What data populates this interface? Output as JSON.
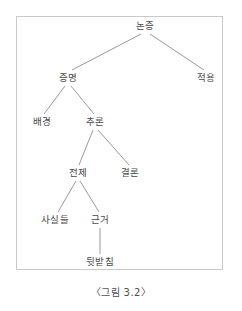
{
  "figure": {
    "caption": "〈그림 3.2〉",
    "frame": {
      "border_color": "#c9c9c9",
      "background": "#ffffff"
    },
    "line_color": "#8d8d8d",
    "text_color": "#4a4a4a"
  },
  "chart_data": {
    "type": "diagram",
    "title": "〈그림 3.2〉",
    "diagram_kind": "tree",
    "orientation": "top-down",
    "nodes": [
      {
        "id": "n0",
        "label": "논증",
        "level": 0,
        "x": 145,
        "y": 26
      },
      {
        "id": "n1",
        "label": "증명",
        "level": 1,
        "x": 68,
        "y": 78
      },
      {
        "id": "n2",
        "label": "적용",
        "level": 1,
        "x": 206,
        "y": 78
      },
      {
        "id": "n3",
        "label": "배경",
        "level": 2,
        "x": 42,
        "y": 122
      },
      {
        "id": "n4",
        "label": "추론",
        "level": 2,
        "x": 95,
        "y": 122
      },
      {
        "id": "n5",
        "label": "전제",
        "level": 3,
        "x": 78,
        "y": 173
      },
      {
        "id": "n6",
        "label": "결론",
        "level": 3,
        "x": 130,
        "y": 173
      },
      {
        "id": "n7",
        "label": "사실들",
        "level": 4,
        "x": 55,
        "y": 220
      },
      {
        "id": "n8",
        "label": "근거",
        "level": 4,
        "x": 100,
        "y": 220
      },
      {
        "id": "n9",
        "label": "뒷받침",
        "level": 5,
        "x": 100,
        "y": 262
      }
    ],
    "edges": [
      {
        "from": "n0",
        "to": "n1",
        "x1": 141,
        "y1": 34,
        "x2": 72,
        "y2": 70
      },
      {
        "from": "n0",
        "to": "n2",
        "x1": 150,
        "y1": 34,
        "x2": 204,
        "y2": 70
      },
      {
        "from": "n1",
        "to": "n3",
        "x1": 65,
        "y1": 86,
        "x2": 44,
        "y2": 114
      },
      {
        "from": "n1",
        "to": "n4",
        "x1": 71,
        "y1": 86,
        "x2": 94,
        "y2": 114
      },
      {
        "from": "n4",
        "to": "n5",
        "x1": 93,
        "y1": 130,
        "x2": 79,
        "y2": 165
      },
      {
        "from": "n4",
        "to": "n6",
        "x1": 98,
        "y1": 130,
        "x2": 129,
        "y2": 165
      },
      {
        "from": "n5",
        "to": "n7",
        "x1": 76,
        "y1": 181,
        "x2": 58,
        "y2": 212
      },
      {
        "from": "n5",
        "to": "n8",
        "x1": 80,
        "y1": 181,
        "x2": 99,
        "y2": 212
      },
      {
        "from": "n8",
        "to": "n9",
        "x1": 100,
        "y1": 228,
        "x2": 100,
        "y2": 254
      }
    ]
  }
}
